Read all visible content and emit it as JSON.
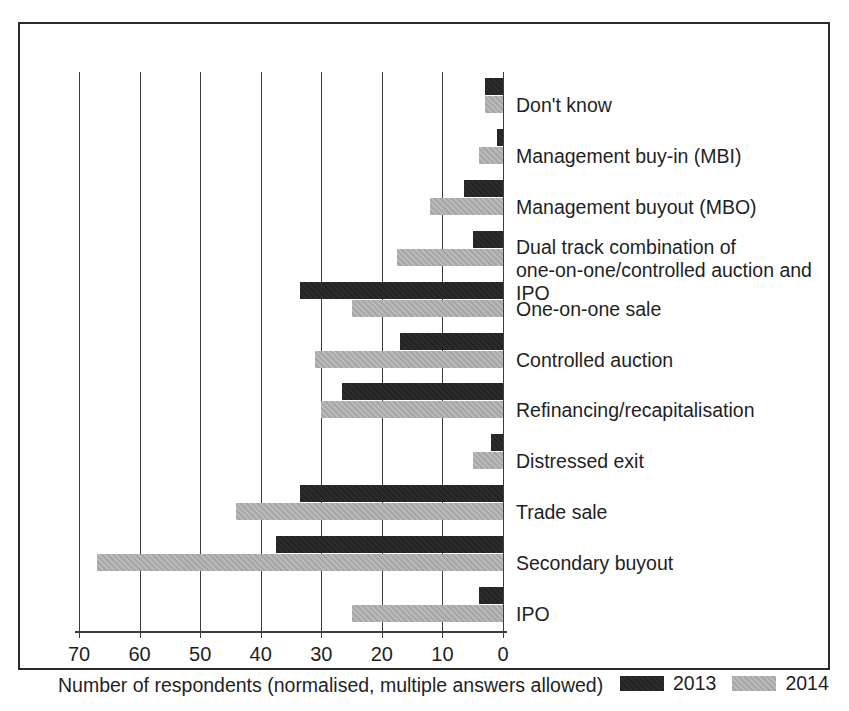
{
  "chart_data": {
    "type": "bar",
    "orientation": "horizontal",
    "title": "",
    "xlabel": "Number of respondents (normalised, multiple answers allowed)",
    "ylabel": "",
    "xlim": [
      70,
      0
    ],
    "x_axis_reversed": true,
    "xticks": [
      70,
      60,
      50,
      40,
      30,
      20,
      10,
      0
    ],
    "xtick_labels": [
      "70",
      "60",
      "50",
      "40",
      "30",
      "20",
      "10",
      "0"
    ],
    "grid": "vertical",
    "legend_position": "bottom-right",
    "categories": [
      "Don't know",
      "Management buy-in (MBI)",
      "Management buyout (MBO)",
      "Dual track combination of\none-on-one/controlled auction and IPO",
      "One-on-one sale",
      "Controlled auction",
      "Refinancing/recapitalisation",
      "Distressed exit",
      "Trade sale",
      "Secondary buyout",
      "IPO"
    ],
    "series": [
      {
        "name": "2013",
        "color": "#232323",
        "values": [
          3,
          1,
          6.5,
          5,
          33.5,
          17,
          26.5,
          2,
          33.5,
          37.5,
          4
        ]
      },
      {
        "name": "2014",
        "color": "#a6a6a6",
        "values": [
          3,
          4,
          12,
          17.5,
          25,
          31,
          30,
          5,
          44,
          67,
          25
        ]
      }
    ]
  },
  "axis": {
    "xtick_labels": [
      "70",
      "60",
      "50",
      "40",
      "30",
      "20",
      "10",
      "0"
    ],
    "x_title": "Number of respondents (normalised, multiple answers allowed)"
  },
  "legend": {
    "items": [
      {
        "label": "2013",
        "color": "#232323"
      },
      {
        "label": "2014",
        "color": "#a6a6a6"
      }
    ]
  },
  "categories": [
    "Don't know",
    "Management buy-in (MBI)",
    "Management buyout (MBO)",
    "Dual track combination of\none-on-one/controlled auction and IPO",
    "One-on-one sale",
    "Controlled auction",
    "Refinancing/recapitalisation",
    "Distressed exit",
    "Trade sale",
    "Secondary buyout",
    "IPO"
  ]
}
